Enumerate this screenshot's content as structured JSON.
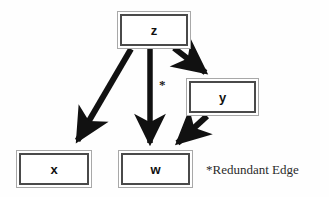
{
  "diagram": {
    "type": "directed-graph",
    "background_color": "#fefefe",
    "edge_color": "#111111",
    "node_border_outer_color": "#a8a8a8",
    "node_border_inner_color": "#4a4a4a",
    "nodes": [
      {
        "id": "z",
        "label": "z",
        "x": 117,
        "y": 11,
        "w": 74,
        "h": 38
      },
      {
        "id": "y",
        "label": "y",
        "x": 186,
        "y": 78,
        "w": 73,
        "h": 38
      },
      {
        "id": "x",
        "label": "x",
        "x": 16,
        "y": 150,
        "w": 76,
        "h": 38
      },
      {
        "id": "w",
        "label": "w",
        "x": 118,
        "y": 150,
        "w": 75,
        "h": 38
      }
    ],
    "edges": [
      {
        "from": "z",
        "to": "x",
        "redundant": false
      },
      {
        "from": "z",
        "to": "y",
        "redundant": false
      },
      {
        "from": "z",
        "to": "w",
        "redundant": true,
        "marker": "*"
      },
      {
        "from": "y",
        "to": "w",
        "redundant": false
      }
    ],
    "annotations": {
      "redundant_marker": "*",
      "redundant_marker_x": 159,
      "redundant_marker_y": 78,
      "legend_text": "*Redundant Edge",
      "legend_x": 206,
      "legend_y": 163
    }
  }
}
